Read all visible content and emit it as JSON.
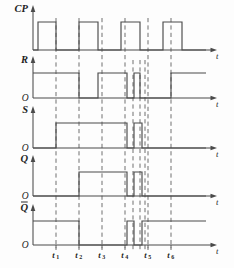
{
  "figure": {
    "type": "digital-timing-diagram",
    "background_color": "#fdfdfd",
    "line_color": "#4a4a4a",
    "marker_color": "#555555",
    "text_color": "#1d1d1d"
  },
  "axes": {
    "time_axis_label": "t",
    "origin_label": "O",
    "x_range": [
      0,
      234
    ],
    "marker_label_prefix": "t"
  },
  "time_markers": [
    {
      "name": "t1",
      "base": "t",
      "sub": "1",
      "x": 56
    },
    {
      "name": "t2",
      "base": "t",
      "sub": "2",
      "x": 79
    },
    {
      "name": "t3",
      "base": "t",
      "sub": "3",
      "x": 102
    },
    {
      "name": "t4",
      "base": "t",
      "sub": "4",
      "x": 125
    },
    {
      "name": "t5",
      "base": "t",
      "sub": "5",
      "x": 148
    },
    {
      "name": "t6",
      "base": "t",
      "sub": "6",
      "x": 171
    }
  ],
  "extra_markers": [
    {
      "name": "m1",
      "x": 133
    },
    {
      "name": "m2",
      "x": 140
    },
    {
      "name": "m3",
      "x": 145
    }
  ],
  "chart_data": {
    "type": "line",
    "title": "",
    "xlabel": "t",
    "ylabel": "",
    "grid": false,
    "legend": "none",
    "x_markers": [
      "t1",
      "t2",
      "t3",
      "t4",
      "t5",
      "t6"
    ],
    "series": [
      {
        "name": "CP",
        "label": "CP",
        "has_origin_label": false,
        "baseline_y": 50,
        "high_y": 22,
        "axis_x": 33,
        "axis_end_x": 212,
        "transitions": [
          {
            "x": 33,
            "level": 0
          },
          {
            "x": 38,
            "level": 1
          },
          {
            "x": 56,
            "level": 0
          },
          {
            "x": 79,
            "level": 1
          },
          {
            "x": 98,
            "level": 0
          },
          {
            "x": 121,
            "level": 1
          },
          {
            "x": 140,
            "level": 0
          },
          {
            "x": 163,
            "level": 1
          },
          {
            "x": 182,
            "level": 0
          },
          {
            "x": 206,
            "level": 0
          }
        ]
      },
      {
        "name": "R",
        "label": "R",
        "has_origin_label": true,
        "baseline_y": 98,
        "high_y": 73,
        "axis_x": 33,
        "axis_end_x": 212,
        "transitions": [
          {
            "x": 33,
            "level": 1
          },
          {
            "x": 79,
            "level": 0
          },
          {
            "x": 98,
            "level": 1
          },
          {
            "x": 127,
            "level": 0
          },
          {
            "x": 134,
            "level": 1
          },
          {
            "x": 140,
            "level": 0
          },
          {
            "x": 171,
            "level": 1
          },
          {
            "x": 206,
            "level": 1
          }
        ]
      },
      {
        "name": "S",
        "label": "S",
        "has_origin_label": true,
        "baseline_y": 148,
        "high_y": 123,
        "axis_x": 33,
        "axis_end_x": 212,
        "transitions": [
          {
            "x": 33,
            "level": 0
          },
          {
            "x": 56,
            "level": 1
          },
          {
            "x": 127,
            "level": 0
          },
          {
            "x": 134,
            "level": 1
          },
          {
            "x": 142,
            "level": 0
          },
          {
            "x": 206,
            "level": 0
          }
        ]
      },
      {
        "name": "Q",
        "label": "Q",
        "has_origin_label": true,
        "baseline_y": 196,
        "high_y": 172,
        "axis_x": 33,
        "axis_end_x": 212,
        "transitions": [
          {
            "x": 33,
            "level": 0
          },
          {
            "x": 79,
            "level": 1
          },
          {
            "x": 127,
            "level": 0
          },
          {
            "x": 134,
            "level": 1
          },
          {
            "x": 142,
            "level": 0
          },
          {
            "x": 206,
            "level": 0
          }
        ]
      },
      {
        "name": "Qbar",
        "label": "Q",
        "overbar": true,
        "has_origin_label": true,
        "baseline_y": 245,
        "high_y": 221,
        "axis_x": 33,
        "axis_end_x": 212,
        "transitions": [
          {
            "x": 33,
            "level": 1
          },
          {
            "x": 79,
            "level": 0
          },
          {
            "x": 127,
            "level": 1
          },
          {
            "x": 134,
            "level": 0
          },
          {
            "x": 142,
            "level": 1
          },
          {
            "x": 206,
            "level": 1
          }
        ]
      }
    ]
  }
}
